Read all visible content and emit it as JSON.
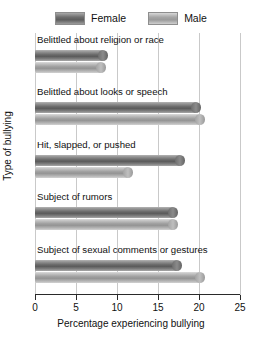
{
  "chart_data": {
    "type": "bar",
    "orientation": "horizontal",
    "title": "",
    "xlabel": "Percentage experiencing bullying",
    "ylabel": "Type of bullying",
    "xlim": [
      0,
      25
    ],
    "xticks": [
      0,
      5,
      10,
      15,
      20,
      25
    ],
    "grid": true,
    "legend_position": "top",
    "categories": [
      "Belittled about religion or race",
      "Belittled about looks or speech",
      "Hit, slapped, or pushed",
      "Subject of rumors",
      "Subject of sexual comments or gestures"
    ],
    "series": [
      {
        "name": "Female",
        "color": "#6b6b6b",
        "values": [
          8.9,
          20.2,
          18.3,
          17.4,
          17.9
        ]
      },
      {
        "name": "Male",
        "color": "#a6a6a6",
        "values": [
          8.7,
          20.7,
          12.0,
          17.4,
          20.7
        ]
      }
    ]
  },
  "legend": {
    "entries": [
      {
        "label": "Female",
        "swatch": "female-swatch"
      },
      {
        "label": "Male",
        "swatch": "male-swatch"
      }
    ]
  },
  "axes": {
    "x_title": "Percentage experiencing bullying",
    "y_title": "Type of bullying",
    "x_tick_labels": [
      "0",
      "5",
      "10",
      "15",
      "20",
      "25"
    ]
  }
}
